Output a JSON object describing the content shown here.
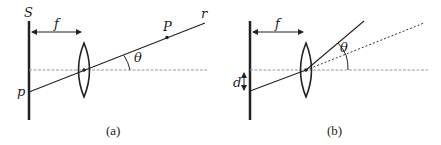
{
  "panels": [
    {
      "id": "a",
      "caption": "(a)",
      "labels": {
        "screen": "S",
        "focal_length": "f",
        "image_point": "p",
        "object_point": "P",
        "ray": "r",
        "angle": "θ"
      }
    },
    {
      "id": "b",
      "caption": "(b)",
      "labels": {
        "focal_length": "f",
        "displacement": "d",
        "angle": "θ"
      }
    }
  ],
  "colors": {
    "line": "#222222",
    "axis": "#9a9a9a"
  }
}
